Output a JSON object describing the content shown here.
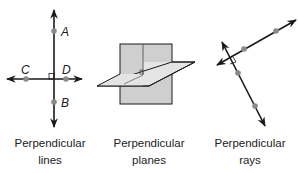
{
  "figures": [
    {
      "id": "lines",
      "caption_line1": "Perpendicular",
      "caption_line2": "lines",
      "points": [
        {
          "label": "A"
        },
        {
          "label": "B"
        },
        {
          "label": "C"
        },
        {
          "label": "D"
        }
      ]
    },
    {
      "id": "planes",
      "caption_line1": "Perpendicular",
      "caption_line2": "planes"
    },
    {
      "id": "rays",
      "caption_line1": "Perpendicular",
      "caption_line2": "rays"
    }
  ],
  "colors": {
    "line": "#1a1a1a",
    "point": "#8a8a8a",
    "plane_fill": "#cfcfcf",
    "plane_fill_light": "#e6e6e6"
  }
}
